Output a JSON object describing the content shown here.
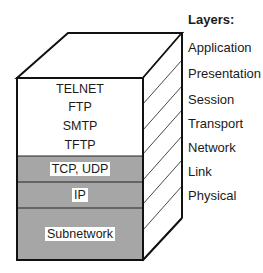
{
  "legend": {
    "title": "Layers:",
    "layers": [
      "Application",
      "Presentation",
      "Session",
      "Transport",
      "Network",
      "Link",
      "Physical"
    ]
  },
  "stack": {
    "top_protocols": [
      "TELNET",
      "FTP",
      "SMTP",
      "TFTP"
    ],
    "bands": [
      {
        "label": "TCP, UDP",
        "fill": "#a6a6a6"
      },
      {
        "label": "IP",
        "fill": "#a6a6a6"
      },
      {
        "label": "Subnetwork",
        "fill": "#a6a6a6"
      }
    ],
    "top_fill": "#ffffff",
    "line_color": "#111111"
  }
}
